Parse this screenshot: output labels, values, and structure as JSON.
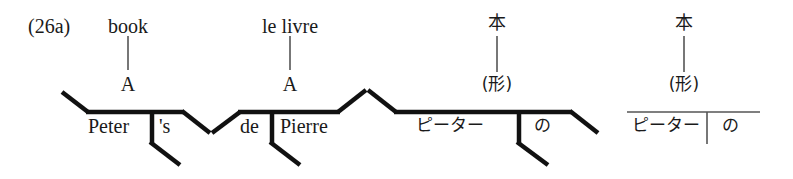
{
  "figure": {
    "number_label": "(26a)",
    "type": "syntactic-tree-diagrams",
    "stroke_color_thick": "#111111",
    "stroke_color_thin": "#555555",
    "background": "#ffffff",
    "panel_count": 4
  },
  "panels": [
    {
      "id": "panel-english",
      "language": "English",
      "head_word": "book",
      "category_label": "A",
      "baseline_terms": [
        "Peter",
        "'s"
      ],
      "line_style": "thick",
      "left_branch": "down-right",
      "right_branch": "down-right",
      "has_divider": true
    },
    {
      "id": "panel-french",
      "language": "French",
      "head_word": "le livre",
      "category_label": "A",
      "baseline_terms": [
        "de",
        "Pierre"
      ],
      "line_style": "thick",
      "left_branch": "up-right",
      "right_branch": "up-right",
      "has_divider": true
    },
    {
      "id": "panel-japanese-a",
      "language": "Japanese",
      "head_word": "本",
      "category_label": "(形)",
      "baseline_terms": [
        "ピーター",
        "の"
      ],
      "line_style": "thick",
      "left_branch": "down-right",
      "right_branch": "down-right",
      "has_divider": true
    },
    {
      "id": "panel-japanese-b",
      "language": "Japanese",
      "head_word": "本",
      "category_label": "(形)",
      "baseline_terms": [
        "ピーター",
        "の"
      ],
      "line_style": "thin",
      "left_branch": "none",
      "right_branch": "none",
      "has_divider": true
    }
  ]
}
